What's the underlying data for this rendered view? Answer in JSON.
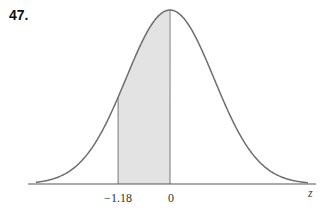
{
  "problem_number": "47.",
  "figure": {
    "type": "normal-distribution-curve",
    "axis_variable": "z",
    "shaded_region": {
      "from": -1.18,
      "to": 0,
      "fill": "#e3e3e3"
    },
    "tick_labels": [
      "-1.18",
      "0"
    ],
    "curve_color": "#6e6e6e",
    "axis_color": "#555555"
  },
  "labels": {
    "left_bound": "−1.18",
    "right_bound": "0",
    "z": "z"
  }
}
